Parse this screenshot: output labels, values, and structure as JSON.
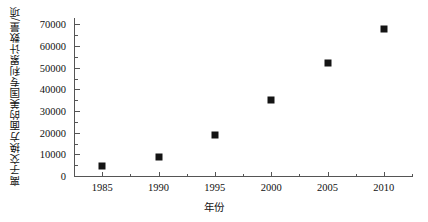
{
  "chart_data": {
    "type": "scatter",
    "title": "",
    "xlabel": "年份",
    "ylabel": "离子交换方面的美国专利累计数量/项",
    "x": [
      1985,
      1990,
      1995,
      2000,
      2005,
      2010
    ],
    "values": [
      4500,
      9000,
      19000,
      35000,
      52000,
      68000
    ],
    "series": [
      {
        "name": "离子交换方面的美国专利累计数量",
        "x": [
          1985,
          1990,
          1995,
          2000,
          2005,
          2010
        ],
        "values": [
          4500,
          9000,
          19000,
          35000,
          52000,
          68000
        ]
      }
    ],
    "xlim": [
      1982.5,
      2012.5
    ],
    "ylim": [
      0,
      73000
    ],
    "xticks": [
      1985,
      1990,
      1995,
      2000,
      2005,
      2010
    ],
    "xtick_labels": [
      "1985",
      "1990",
      "1995",
      "2000",
      "2005",
      "2010"
    ],
    "yticks": [
      0,
      10000,
      20000,
      30000,
      40000,
      50000,
      60000,
      70000
    ],
    "ytick_labels": [
      "0",
      "10000",
      "20000",
      "30000",
      "40000",
      "50000",
      "60000",
      "70000"
    ],
    "minor_ytick_step": 5000,
    "minor_xtick_step": 2.5,
    "grid": false,
    "legend": null,
    "marker": "square",
    "marker_color": "#141414",
    "axis_color": "#555555",
    "background": "#ffffff",
    "frame": "left-bottom-only"
  }
}
